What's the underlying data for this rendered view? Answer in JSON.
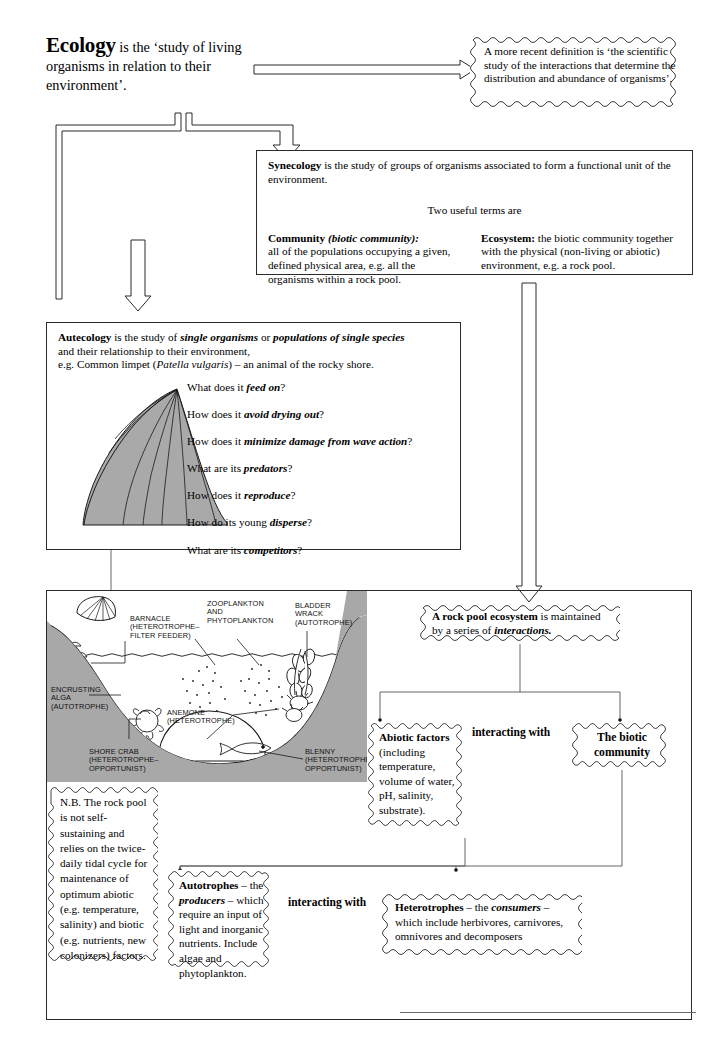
{
  "page": {
    "bottom_rule": true
  },
  "title_block": {
    "heading": "Ecology",
    "text": "is the ‘study of living organisms in relation to their environment’."
  },
  "recent_definition": {
    "text": "A more recent definition is ‘the scientific study of the interactions that determine the distribution and abundance of organisms’."
  },
  "synecology": {
    "term": "Synecology",
    "lead": "is the study of groups of organisms associated to form a functional unit of the environment.",
    "two_terms": "Two useful terms are",
    "community": {
      "term": "Community",
      "term_italic": "(biotic community):",
      "text": "all of the populations occupying a given, defined physical area, e.g. all the organisms within a rock pool."
    },
    "ecosystem": {
      "term": "Ecosystem:",
      "text": "the biotic community together with the physical (non-living or abiotic) environment, e.g. a rock pool."
    }
  },
  "autecology": {
    "term": "Autecology",
    "line1_a": "is the study of",
    "line1_b": "single organisms",
    "line1_c": "or",
    "line1_d": "populations of single  species",
    "line2": "and their relationship to their environment,",
    "line3_a": "e.g. Common limpet (",
    "line3_b": "Patella vulgaris",
    "line3_c": ") – an animal of the rocky shore.",
    "questions": [
      {
        "lead": "What does it ",
        "em": "feed on",
        "tail": "?"
      },
      {
        "lead": "How does it ",
        "em": "avoid drying out",
        "tail": "?"
      },
      {
        "lead": "How does it ",
        "em": "minimize damage from wave action",
        "tail": "?"
      },
      {
        "lead": "What are its ",
        "em": "predators",
        "tail": "?"
      },
      {
        "lead": "How does it ",
        "em": "reproduce",
        "tail": "?"
      },
      {
        "lead": "How do its young ",
        "em": "disperse",
        "tail": "?"
      },
      {
        "lead": "What are its ",
        "em": "competitors",
        "tail": "?"
      }
    ]
  },
  "illustration": {
    "name": "rock-pool-cross-section",
    "labels": [
      {
        "id": "barnacle",
        "text": "BARNACLE\n(HETEROTROPHE–\nFILTER FEEDER)"
      },
      {
        "id": "zooplankton",
        "text": "ZOOPLANKTON\nAND\nPHYTOPLANKTON"
      },
      {
        "id": "bladder-wrack",
        "text": "BLADDER\nWRACK\n(AUTOTROPHE)"
      },
      {
        "id": "encrusting-alga",
        "text": "ENCRUSTING\nALGA\n(AUTOTROPHE)"
      },
      {
        "id": "anemone",
        "text": "ANEMONE\n(HETEROTROPHE)"
      },
      {
        "id": "shore-crab",
        "text": "SHORE CRAB\n(HETEROTROPHE–\nOPPORTUNIST)"
      },
      {
        "id": "blenny",
        "text": "BLENNY\n(HETEROTROPHE–\nOPPORTUNIST)"
      }
    ],
    "colors": {
      "rock": "#a8a8a8",
      "water": "#ffffff",
      "outline": "#1a1a1a"
    }
  },
  "nb_note": {
    "text": "N.B. The rock pool is not self-sustaining and relies on the twice-daily tidal cycle for maintenance of optimum abiotic (e.g. temperature, salinity) and biotic (e.g. nutrients, new colonizers) factors."
  },
  "rock_pool_ecosystem": {
    "term": "A rock pool ecosystem",
    "mid": "is maintained by a series of ",
    "em": "interactions.",
    "tail": ""
  },
  "abiotic_factors": {
    "title": "Abiotic factors",
    "text": "(including temperature, volume of water, pH, salinity, substrate)."
  },
  "biotic_community": {
    "title": "The biotic community"
  },
  "interacting_labels": {
    "upper": "interacting with",
    "lower": "interacting with"
  },
  "autotrophes": {
    "term": "Autotrophes",
    "dash1": " – the ",
    "em1": "producers",
    "tail": " – which require an input of light and inorganic nutrients. Include algae and phytoplankton."
  },
  "heterotrophes": {
    "term": "Heterotrophes",
    "dash1": " – the ",
    "em1": "consumers",
    "tail": " – which include herbivores, carnivores, omnivores and decomposers"
  }
}
